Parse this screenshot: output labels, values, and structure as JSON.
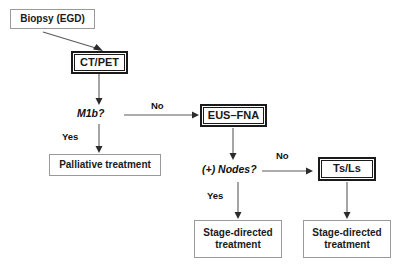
{
  "diagram": {
    "accent_color": "#1a1a1a",
    "edge_color": "#5a5a5a",
    "box_border_plain": "#9a9a9a",
    "background": "#ffffff"
  },
  "nodes": {
    "biopsy": {
      "label": "Biopsy (EGD)",
      "style": "plain"
    },
    "ct_pet": {
      "label": "CT/PET",
      "style": "double"
    },
    "palliative": {
      "label": "Palliative treatment",
      "style": "plain"
    },
    "eus_fna": {
      "label": "EUS–FNA",
      "style": "double"
    },
    "ts_ls": {
      "label": "Ts/Ls",
      "style": "double"
    },
    "stage_directed_left": {
      "label": "Stage-directed\ntreatment",
      "style": "plain"
    },
    "stage_directed_right": {
      "label": "Stage-directed\ntreatment",
      "style": "plain"
    }
  },
  "decisions": {
    "m1b": "M1b?",
    "nodes_positive": "(+) Nodes?"
  },
  "edge_labels": {
    "m1b_no": "No",
    "m1b_yes": "Yes",
    "nodes_no": "No",
    "nodes_yes": "Yes"
  }
}
